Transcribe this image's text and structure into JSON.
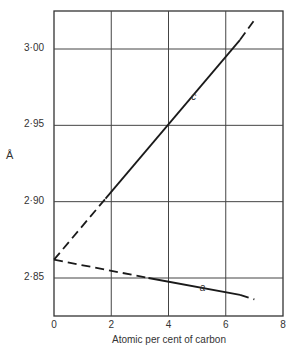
{
  "chart_data": {
    "type": "line",
    "title": "",
    "xlabel": "Atomic per cent of carbon",
    "ylabel": "Å",
    "xlim": [
      0,
      8
    ],
    "ylim": [
      2.82,
      3.025
    ],
    "grid": true,
    "x_ticks": [
      0,
      2,
      4,
      6,
      8
    ],
    "x_tick_labels": [
      "0",
      "2",
      "4",
      "6",
      "8"
    ],
    "y_ticks": [
      2.85,
      2.9,
      2.95,
      3.0
    ],
    "y_tick_labels": [
      "2·85",
      "2·90",
      "2·95",
      "3·00"
    ],
    "series": [
      {
        "name": "c",
        "style": "solid with dashed extrapolation",
        "x": [
          0,
          1.8,
          4,
          6.5,
          7.0
        ],
        "values": [
          2.862,
          2.902,
          2.95,
          3.006,
          3.019
        ],
        "dashed_segments": [
          [
            0,
            1.8
          ],
          [
            6.5,
            7.0
          ]
        ]
      },
      {
        "name": "a",
        "style": "solid with dashed extrapolation",
        "x": [
          0,
          3.3,
          4,
          6.5,
          7.0
        ],
        "values": [
          2.862,
          2.85,
          2.848,
          2.839,
          2.836
        ],
        "dashed_segments": [
          [
            0,
            3.3
          ],
          [
            6.5,
            7.0
          ]
        ]
      }
    ],
    "annotations": [
      {
        "text": "c",
        "x": 4.9,
        "y": 2.968
      },
      {
        "text": "a",
        "x": 5.2,
        "y": 2.843
      }
    ]
  }
}
